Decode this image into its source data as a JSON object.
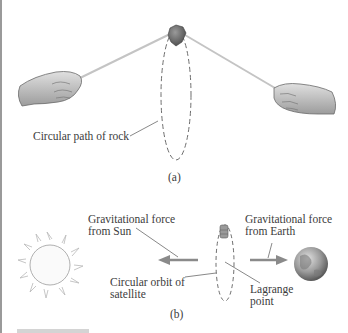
{
  "figure_a": {
    "caption": "(a)",
    "labels": {
      "rock_path": "Circular path of rock"
    }
  },
  "figure_b": {
    "caption": "(b)",
    "labels": {
      "force_sun_line1": "Gravitational force",
      "force_sun_line2": "from Sun",
      "force_earth_line1": "Gravitational force",
      "force_earth_line2": "from Earth",
      "orbit_line1": "Circular orbit of",
      "orbit_line2": "satellite",
      "lagrange_line1": "Lagrange",
      "lagrange_line2": "point"
    }
  },
  "colors": {
    "arrow": "#8a8a8a",
    "dashed_path": "#7a7a7a",
    "string": "#c8c8c8"
  }
}
